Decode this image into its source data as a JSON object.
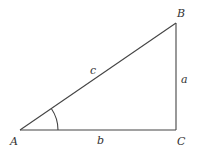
{
  "diagram": {
    "type": "right-triangle",
    "colors": {
      "stroke": "#444444",
      "text": "#333333",
      "background": "#ffffff"
    },
    "vertices": [
      {
        "id": "A",
        "label": "A",
        "x": 20,
        "y": 130
      },
      {
        "id": "B",
        "label": "B",
        "x": 176,
        "y": 23
      },
      {
        "id": "C",
        "label": "C",
        "x": 176,
        "y": 130
      }
    ],
    "sides": [
      {
        "id": "c",
        "label": "c",
        "from": "A",
        "to": "B"
      },
      {
        "id": "a",
        "label": "a",
        "from": "B",
        "to": "C"
      },
      {
        "id": "b",
        "label": "b",
        "from": "A",
        "to": "C"
      }
    ],
    "angle_marks": [
      {
        "at": "A",
        "type": "arc"
      }
    ],
    "labels": {
      "A": "A",
      "B": "B",
      "C": "C",
      "a": "a",
      "b": "b",
      "c": "c"
    }
  }
}
